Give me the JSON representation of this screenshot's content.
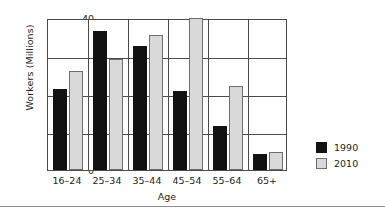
{
  "chart_data": {
    "type": "bar",
    "title": "",
    "xlabel": "Age",
    "ylabel": "Workers (Millions)",
    "categories": [
      "16–24",
      "25–34",
      "35–44",
      "45–54",
      "55–64",
      "65+"
    ],
    "series": [
      {
        "name": "1990",
        "color": "#121212",
        "values": [
          21.3,
          36.5,
          32.7,
          20.8,
          11.7,
          4.2
        ]
      },
      {
        "name": "2010",
        "color": "#d9d9d9",
        "values": [
          26.0,
          29.3,
          35.4,
          40.0,
          22.2,
          4.8
        ]
      }
    ],
    "ylim": [
      0,
      40
    ],
    "yticks": [
      0,
      10,
      20,
      30,
      40
    ],
    "ytick_labels": [
      "0",
      "10",
      "20",
      "30",
      "40"
    ],
    "grid": "horizontal-and-category-separators",
    "legend_position": "right"
  },
  "legend": {
    "items": [
      {
        "label": "1990",
        "swatch": "black-square-icon"
      },
      {
        "label": "2010",
        "swatch": "light-gray-square-icon"
      }
    ]
  }
}
